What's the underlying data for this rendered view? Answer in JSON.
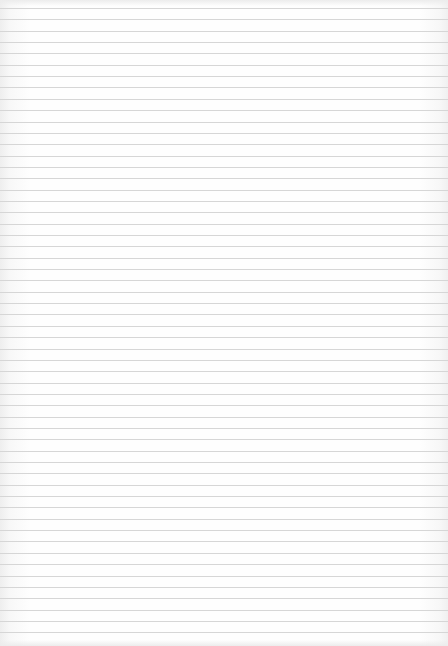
{
  "paper": {
    "type": "ruled-lined-paper",
    "line_count": 56,
    "first_line_y": 8,
    "line_spacing": 11.35,
    "line_color": "#d6d6d6",
    "background_color": "#fefefe",
    "text": ""
  }
}
